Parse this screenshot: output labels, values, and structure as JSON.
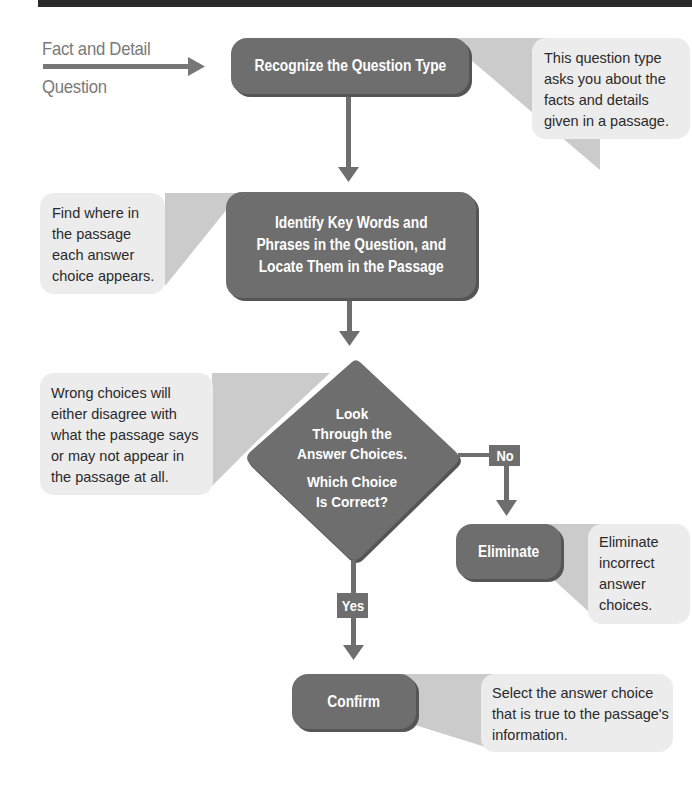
{
  "diagram": {
    "type": "flowchart",
    "intro_label": {
      "line1": "Fact and Detail",
      "line2": "Question"
    },
    "steps": [
      {
        "id": "recognize",
        "label": "Recognize the Question Type",
        "callout": [
          "This question type",
          "asks you about the",
          "facts and details",
          "given in a passage."
        ]
      },
      {
        "id": "identify",
        "label_lines": [
          "Identify Key Words and",
          "Phrases in the Question, and",
          "Locate Them in the Passage"
        ],
        "callout": [
          "Find where in",
          "the passage",
          "each answer",
          "choice appears."
        ]
      },
      {
        "id": "decision",
        "label_lines": [
          "Look",
          "Through the",
          "Answer Choices."
        ],
        "question_lines": [
          "Which Choice",
          "Is Correct?"
        ],
        "callout": [
          "Wrong choices will",
          "either disagree with",
          "what the passage says",
          "or may not appear in",
          "the passage at all."
        ]
      },
      {
        "id": "eliminate",
        "label": "Eliminate",
        "callout": [
          "Eliminate",
          "incorrect",
          "answer",
          "choices."
        ]
      },
      {
        "id": "confirm",
        "label": "Confirm",
        "callout": [
          "Select the answer choice",
          "that is true to the passage's",
          "information."
        ]
      }
    ],
    "branches": {
      "no": "No",
      "yes": "Yes"
    },
    "colors": {
      "box": "#6e6e6e",
      "box_shadow": "#555555",
      "callout_bg": "#ececec",
      "wedge": "#c8c8c8",
      "arrow": "#6e6e6e",
      "intro_text": "#7a7a7a",
      "topbar": "#2b2b2b"
    }
  }
}
